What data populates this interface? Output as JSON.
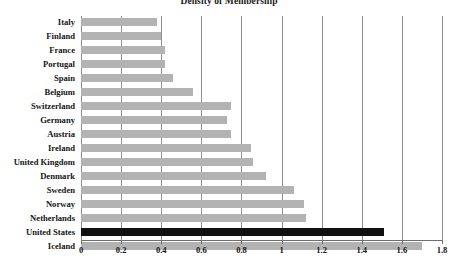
{
  "chart_data": {
    "type": "bar",
    "orientation": "horizontal",
    "title": "Density of Membership",
    "xlabel": "",
    "ylabel": "",
    "xlim": [
      0,
      1.8
    ],
    "xticks": [
      "0",
      "0.2",
      "0.4",
      "0.6",
      "0.8",
      "1",
      "1.2",
      "1.4",
      "1.6",
      "1.8"
    ],
    "xtick_values": [
      0,
      0.2,
      0.4,
      0.6,
      0.8,
      1.0,
      1.2,
      1.4,
      1.6,
      1.8
    ],
    "grid": true,
    "grid_axis": "x",
    "legend": "none",
    "categories": [
      "Italy",
      "Finland",
      "France",
      "Portugal",
      "Spain",
      "Belgium",
      "Switzerland",
      "Germany",
      "Austria",
      "Ireland",
      "United Kingdom",
      "Denmark",
      "Sweden",
      "Norway",
      "Netherlands",
      "United States",
      "Iceland"
    ],
    "values": [
      0.38,
      0.4,
      0.42,
      0.42,
      0.46,
      0.56,
      0.75,
      0.73,
      0.75,
      0.85,
      0.86,
      0.92,
      1.06,
      1.11,
      1.12,
      1.51,
      1.7
    ],
    "bars": [
      {
        "label": "Italy",
        "value": 0.38,
        "highlight": false
      },
      {
        "label": "Finland",
        "value": 0.4,
        "highlight": false
      },
      {
        "label": "France",
        "value": 0.42,
        "highlight": false
      },
      {
        "label": "Portugal",
        "value": 0.42,
        "highlight": false
      },
      {
        "label": "Spain",
        "value": 0.46,
        "highlight": false
      },
      {
        "label": "Belgium",
        "value": 0.56,
        "highlight": false
      },
      {
        "label": "Switzerland",
        "value": 0.75,
        "highlight": false
      },
      {
        "label": "Germany",
        "value": 0.73,
        "highlight": false
      },
      {
        "label": "Austria",
        "value": 0.75,
        "highlight": false
      },
      {
        "label": "Ireland",
        "value": 0.85,
        "highlight": false
      },
      {
        "label": "United Kingdom",
        "value": 0.86,
        "highlight": false
      },
      {
        "label": "Denmark",
        "value": 0.92,
        "highlight": false
      },
      {
        "label": "Sweden",
        "value": 1.06,
        "highlight": false
      },
      {
        "label": "Norway",
        "value": 1.11,
        "highlight": false
      },
      {
        "label": "Netherlands",
        "value": 1.12,
        "highlight": false
      },
      {
        "label": "United States",
        "value": 1.51,
        "highlight": true
      },
      {
        "label": "Iceland",
        "value": 1.7,
        "highlight": false
      }
    ],
    "colors": {
      "bar": "#b3b3b3",
      "highlight_bar": "#111111",
      "grid": "#8d8d8d",
      "axis": "#6e6e6e",
      "text": "#141414",
      "background": "#ffffff"
    }
  }
}
